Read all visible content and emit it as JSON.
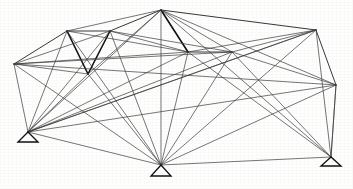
{
  "figure": {
    "type": "line-diagram",
    "width": 353,
    "height": 189,
    "background_color": "#ffffff",
    "line_color": "#101010",
    "line_color_light": "#3a3a3a"
  },
  "chart_data": {
    "type": "diagram",
    "xlabel": "",
    "ylabel": "",
    "grid": false,
    "legend": false,
    "nodes": [
      {
        "id": "N1",
        "label": "left-upper-chord",
        "x": 14,
        "y": 64
      },
      {
        "id": "N2",
        "label": "top-left-panel",
        "x": 67,
        "y": 31
      },
      {
        "id": "N3",
        "label": "top-left-inner",
        "x": 110,
        "y": 31
      },
      {
        "id": "N4",
        "label": "mid-left-low",
        "x": 88,
        "y": 74
      },
      {
        "id": "N5",
        "label": "apex",
        "x": 161,
        "y": 10
      },
      {
        "id": "N6",
        "label": "mid-inner-left",
        "x": 188,
        "y": 52
      },
      {
        "id": "N7",
        "label": "mid-inner-right",
        "x": 232,
        "y": 52
      },
      {
        "id": "N8",
        "label": "top-right-panel",
        "x": 316,
        "y": 30
      },
      {
        "id": "N9",
        "label": "right-upper-chord",
        "x": 336,
        "y": 85
      },
      {
        "id": "S1",
        "label": "support-left",
        "x": 28,
        "y": 132
      },
      {
        "id": "S2",
        "label": "support-center",
        "x": 161,
        "y": 165
      },
      {
        "id": "S3",
        "label": "support-right",
        "x": 331,
        "y": 157
      }
    ],
    "members": [
      {
        "from": "N1",
        "to": "N2",
        "weight": "med"
      },
      {
        "from": "N2",
        "to": "N3",
        "weight": "med"
      },
      {
        "from": "N3",
        "to": "N5",
        "weight": "med"
      },
      {
        "from": "N5",
        "to": "N8",
        "weight": "med"
      },
      {
        "from": "N8",
        "to": "N9",
        "weight": "med"
      },
      {
        "from": "N1",
        "to": "S1",
        "weight": "thin"
      },
      {
        "from": "N9",
        "to": "S3",
        "weight": "thin"
      },
      {
        "from": "N2",
        "to": "N4",
        "weight": "thick"
      },
      {
        "from": "N3",
        "to": "N4",
        "weight": "thick"
      },
      {
        "from": "N6",
        "to": "N7",
        "weight": "med"
      },
      {
        "from": "N5",
        "to": "N6",
        "weight": "thick"
      },
      {
        "from": "N5",
        "to": "N7",
        "weight": "thin"
      },
      {
        "from": "N5",
        "to": "N9",
        "weight": "thin"
      },
      {
        "from": "N5",
        "to": "N2",
        "weight": "thin"
      },
      {
        "from": "N5",
        "to": "N4",
        "weight": "thin"
      },
      {
        "from": "N5",
        "to": "S1",
        "weight": "thin"
      },
      {
        "from": "N5",
        "to": "S2",
        "weight": "thin"
      },
      {
        "from": "N5",
        "to": "S3",
        "weight": "thin"
      },
      {
        "from": "N1",
        "to": "N4",
        "weight": "thin"
      },
      {
        "from": "N1",
        "to": "N6",
        "weight": "thin"
      },
      {
        "from": "N1",
        "to": "N7",
        "weight": "thin"
      },
      {
        "from": "N1",
        "to": "S2",
        "weight": "thin"
      },
      {
        "from": "N1",
        "to": "N3",
        "weight": "thin"
      },
      {
        "from": "N2",
        "to": "S1",
        "weight": "thin"
      },
      {
        "from": "N2",
        "to": "S2",
        "weight": "thin"
      },
      {
        "from": "N2",
        "to": "N6",
        "weight": "thin"
      },
      {
        "from": "N3",
        "to": "S1",
        "weight": "thin"
      },
      {
        "from": "N3",
        "to": "S2",
        "weight": "thin"
      },
      {
        "from": "N3",
        "to": "N6",
        "weight": "thin"
      },
      {
        "from": "N3",
        "to": "N7",
        "weight": "thin"
      },
      {
        "from": "N4",
        "to": "S1",
        "weight": "thin"
      },
      {
        "from": "N4",
        "to": "S2",
        "weight": "thin"
      },
      {
        "from": "N6",
        "to": "S1",
        "weight": "thin"
      },
      {
        "from": "N6",
        "to": "S2",
        "weight": "thin"
      },
      {
        "from": "N6",
        "to": "S3",
        "weight": "thin"
      },
      {
        "from": "N7",
        "to": "S1",
        "weight": "thin"
      },
      {
        "from": "N7",
        "to": "S2",
        "weight": "thin"
      },
      {
        "from": "N7",
        "to": "S3",
        "weight": "thin"
      },
      {
        "from": "N7",
        "to": "N9",
        "weight": "thin"
      },
      {
        "from": "N8",
        "to": "N6",
        "weight": "thin"
      },
      {
        "from": "N8",
        "to": "N7",
        "weight": "thin"
      },
      {
        "from": "N8",
        "to": "S2",
        "weight": "thin"
      },
      {
        "from": "N8",
        "to": "S3",
        "weight": "thin"
      },
      {
        "from": "N8",
        "to": "S1",
        "weight": "thin"
      },
      {
        "from": "N9",
        "to": "S1",
        "weight": "thin"
      },
      {
        "from": "N9",
        "to": "S2",
        "weight": "thin"
      },
      {
        "from": "N9",
        "to": "S3",
        "weight": "thin"
      },
      {
        "from": "S1",
        "to": "S2",
        "weight": "thin"
      },
      {
        "from": "S2",
        "to": "S3",
        "weight": "thin"
      },
      {
        "from": "S1",
        "to": "N8",
        "weight": "thin"
      },
      {
        "from": "N1",
        "to": "N9",
        "weight": "thin"
      }
    ],
    "supports": [
      {
        "id": "S1",
        "label": "support-left",
        "apex_x": 28,
        "apex_y": 132,
        "half_width": 10,
        "height": 10
      },
      {
        "id": "S2",
        "label": "support-center",
        "apex_x": 161,
        "apex_y": 165,
        "half_width": 10,
        "height": 11
      },
      {
        "id": "S3",
        "label": "support-right",
        "apex_x": 331,
        "apex_y": 157,
        "half_width": 10,
        "height": 9
      }
    ]
  }
}
